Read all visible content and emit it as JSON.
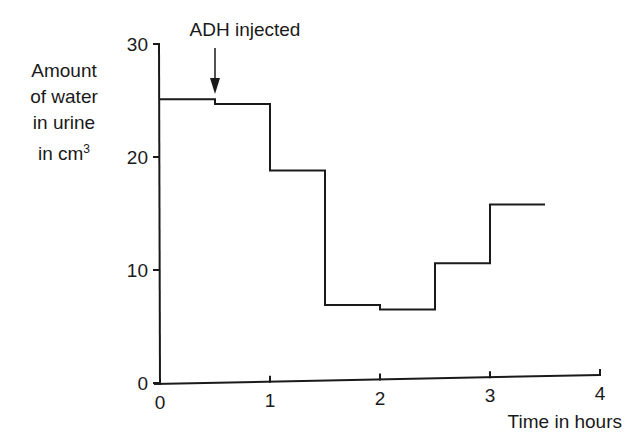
{
  "chart_data": {
    "type": "line",
    "style": "step",
    "title": "",
    "xlabel": "Time in hours",
    "ylabel_lines": [
      "Amount",
      "of water",
      "in urine",
      "in cm"
    ],
    "ylabel_superscript": "3",
    "xlim": [
      0,
      4
    ],
    "ylim": [
      0,
      30
    ],
    "x_ticks": [
      "0",
      "1",
      "2",
      "3",
      "4"
    ],
    "y_ticks": [
      "0",
      "10",
      "20",
      "30"
    ],
    "grid": false,
    "legend": null,
    "annotation": {
      "text": "ADH injected",
      "x": 0.5,
      "arrow": "down"
    },
    "steps": [
      {
        "x_start": 0.0,
        "x_end": 0.5,
        "value": 25.1
      },
      {
        "x_start": 0.5,
        "x_end": 1.0,
        "value": 24.7
      },
      {
        "x_start": 1.0,
        "x_end": 1.5,
        "value": 18.8
      },
      {
        "x_start": 1.5,
        "x_end": 2.0,
        "value": 6.9
      },
      {
        "x_start": 2.0,
        "x_end": 2.5,
        "value": 6.5
      },
      {
        "x_start": 2.5,
        "x_end": 3.0,
        "value": 10.6
      },
      {
        "x_start": 3.0,
        "x_end": 3.5,
        "value": 15.8
      }
    ],
    "series": [
      {
        "name": "Amount of water in urine (cm3)",
        "x": [
          0,
          0.5,
          1.0,
          1.5,
          2.0,
          2.5,
          3.0
        ],
        "values": [
          25.1,
          24.7,
          18.8,
          6.9,
          6.5,
          10.6,
          15.8
        ]
      }
    ]
  }
}
